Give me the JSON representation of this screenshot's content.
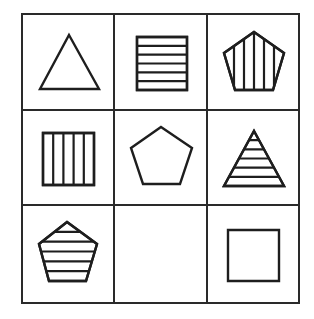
{
  "puzzle": {
    "type": "3x3 matrix reasoning puzzle",
    "rows": 3,
    "cols": 3,
    "grid": {
      "x": [
        22,
        114,
        207,
        299
      ],
      "y": [
        14,
        110,
        205,
        303
      ],
      "line_color": "#2a2a2a"
    },
    "ink_color": "#1e1e1e",
    "background": "#ffffff",
    "cells": [
      {
        "row": 0,
        "col": 0,
        "shape": "triangle",
        "fill": "none",
        "hatch_count": 0,
        "points": [
          [
            69,
            35
          ],
          [
            99,
            89
          ],
          [
            40,
            89
          ]
        ]
      },
      {
        "row": 0,
        "col": 1,
        "shape": "square",
        "fill": "horizontal-lines",
        "hatch_count": 5,
        "points": [
          [
            137,
            37
          ],
          [
            187,
            37
          ],
          [
            187,
            90
          ],
          [
            137,
            90
          ]
        ]
      },
      {
        "row": 0,
        "col": 2,
        "shape": "pentagon",
        "fill": "vertical-lines",
        "hatch_count": 5,
        "points": [
          [
            254,
            32
          ],
          [
            284,
            53
          ],
          [
            273,
            90
          ],
          [
            235,
            90
          ],
          [
            224,
            53
          ]
        ]
      },
      {
        "row": 1,
        "col": 0,
        "shape": "square",
        "fill": "vertical-lines",
        "hatch_count": 4,
        "points": [
          [
            43,
            133
          ],
          [
            94,
            133
          ],
          [
            94,
            185
          ],
          [
            43,
            185
          ]
        ]
      },
      {
        "row": 1,
        "col": 1,
        "shape": "pentagon",
        "fill": "none",
        "hatch_count": 0,
        "points": [
          [
            161,
            127
          ],
          [
            192,
            148
          ],
          [
            180,
            184
          ],
          [
            143,
            184
          ],
          [
            131,
            148
          ]
        ]
      },
      {
        "row": 1,
        "col": 2,
        "shape": "triangle",
        "fill": "horizontal-lines",
        "hatch_count": 5,
        "points": [
          [
            254,
            131
          ],
          [
            284,
            186
          ],
          [
            224,
            186
          ]
        ]
      },
      {
        "row": 2,
        "col": 0,
        "shape": "pentagon",
        "fill": "horizontal-lines",
        "hatch_count": 5,
        "points": [
          [
            67,
            222
          ],
          [
            97,
            244
          ],
          [
            86,
            281
          ],
          [
            49,
            281
          ],
          [
            39,
            244
          ]
        ]
      },
      {
        "row": 2,
        "col": 1,
        "shape": "empty",
        "fill": "none",
        "hatch_count": 0,
        "points": []
      },
      {
        "row": 2,
        "col": 2,
        "shape": "square",
        "fill": "none",
        "hatch_count": 0,
        "points": [
          [
            228,
            230
          ],
          [
            279,
            230
          ],
          [
            279,
            281
          ],
          [
            228,
            281
          ]
        ]
      }
    ]
  }
}
